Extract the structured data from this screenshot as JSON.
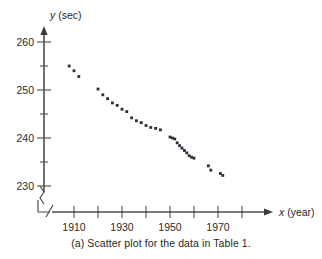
{
  "figure": {
    "caption": "(a) Scatter plot for the data in Table 1."
  },
  "chart_data": {
    "type": "scatter",
    "title": "",
    "xlabel": "x (year)",
    "ylabel": "y (sec)",
    "xlabel_variable": "x",
    "xlabel_unit": "(year)",
    "ylabel_variable": "y",
    "ylabel_unit": "(sec)",
    "xlim": [
      1900,
      1985
    ],
    "ylim": [
      228,
      262
    ],
    "x_major_ticks": [
      1910,
      1930,
      1950,
      1970
    ],
    "x_minor_ticks": [
      1900,
      1920,
      1940,
      1960,
      1980
    ],
    "x_tick_labels": [
      "1910",
      "1930",
      "1950",
      "1970"
    ],
    "y_major_ticks": [
      230,
      240,
      250,
      260
    ],
    "y_minor_ticks": [
      235,
      245,
      255
    ],
    "y_tick_labels": [
      "230",
      "240",
      "250",
      "260"
    ],
    "grid": false,
    "legend": null,
    "axis_break_x": true,
    "axis_break_y": true,
    "marker": "square",
    "marker_color": "#2b2b3a",
    "points": [
      [
        1908,
        255.0
      ],
      [
        1910,
        254.0
      ],
      [
        1912,
        252.8
      ],
      [
        1920,
        250.2
      ],
      [
        1922,
        249.0
      ],
      [
        1924,
        248.2
      ],
      [
        1926,
        247.3
      ],
      [
        1928,
        246.8
      ],
      [
        1930,
        246.0
      ],
      [
        1932,
        245.5
      ],
      [
        1934,
        244.2
      ],
      [
        1936,
        243.6
      ],
      [
        1938,
        243.2
      ],
      [
        1940,
        242.6
      ],
      [
        1942,
        242.2
      ],
      [
        1944,
        242.0
      ],
      [
        1946,
        241.7
      ],
      [
        1950,
        240.2
      ],
      [
        1951,
        240.0
      ],
      [
        1952,
        239.8
      ],
      [
        1953,
        239.0
      ],
      [
        1954,
        238.4
      ],
      [
        1955,
        237.9
      ],
      [
        1956,
        237.4
      ],
      [
        1957,
        236.9
      ],
      [
        1958,
        236.3
      ],
      [
        1959,
        236.0
      ],
      [
        1960,
        235.8
      ],
      [
        1966,
        234.2
      ],
      [
        1967,
        233.3
      ],
      [
        1971,
        232.6
      ],
      [
        1972,
        232.2
      ]
    ]
  }
}
